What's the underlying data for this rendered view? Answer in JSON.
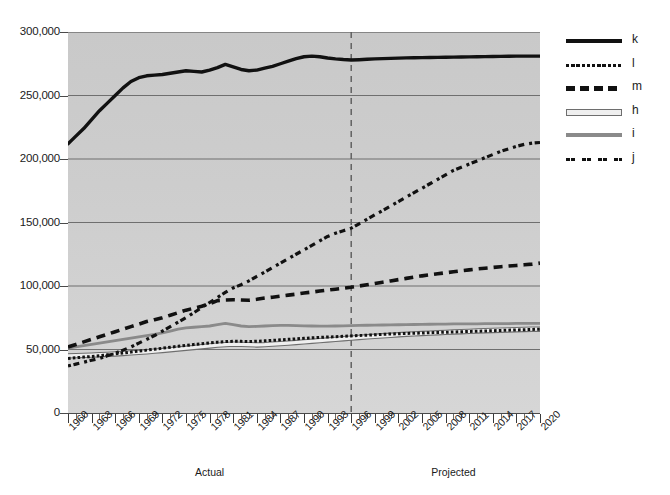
{
  "chart_data": {
    "type": "line",
    "title": "",
    "subtitle": "",
    "xlabel": "",
    "ylabel": "",
    "xlim": [
      1960,
      2020
    ],
    "ylim": [
      0,
      300000
    ],
    "grid": true,
    "legend_position": "right",
    "y_ticks": [
      "0",
      "50,000",
      "100,000",
      "150,000",
      "200,000",
      "250,000",
      "300,000"
    ],
    "y_tick_values": [
      0,
      50000,
      100000,
      150000,
      200000,
      250000,
      300000
    ],
    "x_ticks": [
      "1960",
      "1963",
      "1966",
      "1969",
      "1972",
      "1975",
      "1978",
      "1981",
      "1984",
      "1987",
      "1990",
      "1993",
      "1996",
      "1999",
      "2002",
      "2005",
      "2008",
      "2011",
      "2014",
      "2017",
      "2020"
    ],
    "x_tick_values": [
      1960,
      1963,
      1966,
      1969,
      1972,
      1975,
      1978,
      1981,
      1984,
      1987,
      1990,
      1993,
      1996,
      1999,
      2002,
      2005,
      2008,
      2011,
      2014,
      2017,
      2020
    ],
    "x_tick_step_minor": 1,
    "annotations": [
      {
        "name": "actual-label",
        "text": "Actual",
        "x": 1978
      },
      {
        "name": "projected-label",
        "text": "Projected",
        "x": 2009
      }
    ],
    "divider": {
      "name": "projection-divider",
      "x": 1996,
      "style": "dashed",
      "color": "#5a5a5a"
    },
    "colors": {
      "plot_background": "#cfcfcf",
      "gridline": "#6f6f6f",
      "axis": "#3f3f3f",
      "series_dark": "#111111",
      "series_gray": "#8a8a8a",
      "series_light": "#efefef"
    },
    "x": [
      1960,
      1961,
      1962,
      1963,
      1964,
      1965,
      1966,
      1967,
      1968,
      1969,
      1970,
      1971,
      1972,
      1973,
      1974,
      1975,
      1976,
      1977,
      1978,
      1979,
      1980,
      1981,
      1982,
      1983,
      1984,
      1985,
      1986,
      1987,
      1988,
      1989,
      1990,
      1991,
      1992,
      1993,
      1994,
      1995,
      1996,
      1997,
      1998,
      1999,
      2000,
      2001,
      2002,
      2003,
      2004,
      2005,
      2006,
      2007,
      2008,
      2009,
      2010,
      2011,
      2012,
      2013,
      2014,
      2015,
      2016,
      2017,
      2018,
      2019,
      2020
    ],
    "series": [
      {
        "name": "k",
        "label": "k",
        "style": "solid-thick",
        "color": "#111111",
        "values": [
          212000,
          218000,
          224000,
          231000,
          238000,
          244000,
          250000,
          256000,
          261000,
          264000,
          265500,
          266000,
          266500,
          267500,
          268500,
          269500,
          269000,
          268500,
          270000,
          272000,
          274500,
          272500,
          270500,
          269500,
          270000,
          271500,
          273000,
          275000,
          277000,
          279000,
          280500,
          281000,
          280500,
          279500,
          278800,
          278300,
          278000,
          278200,
          278500,
          278800,
          279000,
          279200,
          279400,
          279600,
          279700,
          279800,
          279900,
          280000,
          280100,
          280200,
          280300,
          280400,
          280500,
          280600,
          280700,
          280800,
          280900,
          281000,
          281000,
          281000,
          281000
        ]
      },
      {
        "name": "l",
        "label": "l",
        "style": "dotted-fine",
        "color": "#111111",
        "values": [
          43000,
          43500,
          44000,
          44500,
          45000,
          45800,
          46500,
          47300,
          48000,
          48800,
          49500,
          50200,
          51000,
          51800,
          52500,
          53200,
          54000,
          54600,
          55200,
          55800,
          56200,
          56500,
          56400,
          56300,
          56500,
          56800,
          57200,
          57600,
          58000,
          58400,
          58800,
          59200,
          59500,
          59800,
          60100,
          60400,
          60700,
          61000,
          61300,
          61600,
          61900,
          62200,
          62400,
          62600,
          62800,
          63000,
          63200,
          63400,
          63600,
          63800,
          64000,
          64200,
          64400,
          64600,
          64800,
          65000,
          65200,
          65400,
          65600,
          65800,
          66000
        ]
      },
      {
        "name": "m",
        "label": "m",
        "style": "dashed",
        "color": "#111111",
        "values": [
          52000,
          54000,
          56000,
          58000,
          60000,
          62000,
          64000,
          66000,
          68000,
          70000,
          72000,
          73500,
          75000,
          77000,
          79000,
          81000,
          82500,
          84000,
          86000,
          88500,
          89000,
          89200,
          89000,
          88800,
          89500,
          90500,
          91200,
          92000,
          92800,
          93600,
          94500,
          95200,
          96000,
          96800,
          97500,
          98200,
          99000,
          100000,
          101000,
          102000,
          103000,
          104000,
          105000,
          106000,
          107000,
          108000,
          108800,
          109600,
          110400,
          111200,
          112000,
          112700,
          113400,
          114000,
          114600,
          115200,
          115700,
          116200,
          116700,
          117200,
          118000
        ]
      },
      {
        "name": "h",
        "label": "h",
        "style": "outlined-light",
        "color": "#efefef",
        "values": [
          45000,
          45200,
          45400,
          45600,
          45900,
          46200,
          46500,
          46900,
          47300,
          47700,
          48200,
          48700,
          49200,
          49800,
          50400,
          51000,
          51600,
          52200,
          52800,
          53400,
          53800,
          54200,
          54000,
          53800,
          53600,
          53800,
          54200,
          54600,
          55000,
          55500,
          56000,
          56500,
          57000,
          57500,
          58000,
          58500,
          59000,
          59500,
          60000,
          60400,
          60800,
          61200,
          61600,
          62000,
          62300,
          62600,
          62900,
          63200,
          63500,
          63800,
          64000,
          64300,
          64600,
          64800,
          65000,
          65200,
          65400,
          65600,
          65800,
          66000,
          66000
        ]
      },
      {
        "name": "i",
        "label": "i",
        "style": "solid-gray",
        "color": "#8a8a8a",
        "values": [
          51000,
          52000,
          53000,
          54000,
          55000,
          56000,
          57000,
          58000,
          59000,
          60000,
          61000,
          62000,
          63000,
          64500,
          66000,
          67000,
          67500,
          68000,
          68500,
          69500,
          70500,
          69500,
          68500,
          68000,
          68200,
          68500,
          68800,
          69000,
          69000,
          68800,
          68600,
          68500,
          68400,
          68400,
          68500,
          68600,
          68800,
          69000,
          69100,
          69200,
          69300,
          69400,
          69500,
          69600,
          69700,
          69800,
          69900,
          70000,
          70000,
          70100,
          70100,
          70200,
          70200,
          70300,
          70300,
          70400,
          70400,
          70500,
          70500,
          70500,
          70500
        ]
      },
      {
        "name": "j",
        "label": "j",
        "style": "dash-dot",
        "color": "#111111",
        "values": [
          37000,
          38500,
          40000,
          41500,
          43000,
          45000,
          47000,
          49500,
          52000,
          55000,
          58000,
          61000,
          64500,
          68000,
          71500,
          75000,
          79000,
          83000,
          87000,
          91000,
          95000,
          98500,
          101000,
          104000,
          107500,
          111000,
          114500,
          118000,
          121500,
          125000,
          128500,
          132000,
          135500,
          139000,
          141500,
          143500,
          145500,
          149000,
          152500,
          156000,
          159500,
          163000,
          166500,
          170000,
          173500,
          177000,
          180500,
          184000,
          187500,
          191000,
          193500,
          196000,
          198500,
          201000,
          203500,
          206000,
          208000,
          210000,
          211500,
          212500,
          213000
        ]
      }
    ]
  },
  "legend": {
    "items": [
      {
        "name": "k",
        "label": "k"
      },
      {
        "name": "l",
        "label": "l"
      },
      {
        "name": "m",
        "label": "m"
      },
      {
        "name": "h",
        "label": "h"
      },
      {
        "name": "i",
        "label": "i"
      },
      {
        "name": "j",
        "label": "j"
      }
    ]
  }
}
